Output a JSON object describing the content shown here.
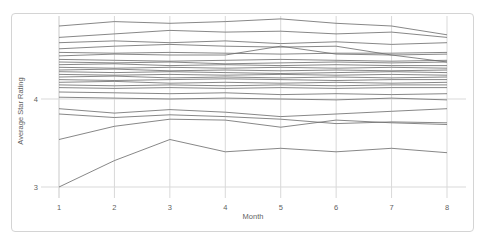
{
  "frame": {
    "background": "#ffffff",
    "card_border_color": "#d4d4d4"
  },
  "chart_data": {
    "type": "line",
    "title": "",
    "xlabel": "Month",
    "ylabel": "Average Star Rating",
    "x": [
      1,
      2,
      3,
      4,
      5,
      6,
      7,
      8
    ],
    "x_tick_labels": [
      "1",
      "2",
      "3",
      "4",
      "5",
      "6",
      "7",
      "8"
    ],
    "y_ticks": [
      {
        "value": 3,
        "label": "3"
      },
      {
        "value": 4,
        "label": "4"
      }
    ],
    "xlim": [
      1,
      8
    ],
    "ylim": [
      2.875,
      4.94
    ],
    "grid": true,
    "legend_position": "none",
    "line_color": "#6b6b6b",
    "grid_color": "#d9d9d9",
    "axis_text_color": "#5f5f5f",
    "series": [
      {
        "name": "line-01",
        "values": [
          4.83,
          4.88,
          4.86,
          4.88,
          4.91,
          4.86,
          4.83,
          4.73
        ]
      },
      {
        "name": "line-02",
        "values": [
          4.7,
          4.74,
          4.78,
          4.76,
          4.77,
          4.74,
          4.76,
          4.7
        ]
      },
      {
        "name": "line-03",
        "values": [
          4.64,
          4.66,
          4.64,
          4.66,
          4.63,
          4.65,
          4.62,
          4.64
        ]
      },
      {
        "name": "line-04",
        "values": [
          4.57,
          4.6,
          4.62,
          4.6,
          4.59,
          4.6,
          4.5,
          4.42
        ]
      },
      {
        "name": "line-05",
        "values": [
          4.49,
          4.51,
          4.5,
          4.5,
          4.6,
          4.51,
          4.5,
          4.51
        ]
      },
      {
        "name": "line-06",
        "values": [
          4.53,
          4.52,
          4.53,
          4.52,
          4.51,
          4.52,
          4.52,
          4.53
        ]
      },
      {
        "name": "line-07",
        "values": [
          4.45,
          4.44,
          4.43,
          4.44,
          4.45,
          4.44,
          4.43,
          4.44
        ]
      },
      {
        "name": "line-08",
        "values": [
          4.42,
          4.41,
          4.42,
          4.4,
          4.41,
          4.42,
          4.41,
          4.42
        ]
      },
      {
        "name": "line-09",
        "values": [
          4.39,
          4.4,
          4.38,
          4.39,
          4.38,
          4.39,
          4.38,
          4.38
        ]
      },
      {
        "name": "line-10",
        "values": [
          4.36,
          4.35,
          4.36,
          4.35,
          4.36,
          4.35,
          4.36,
          4.35
        ]
      },
      {
        "name": "line-11",
        "values": [
          4.33,
          4.34,
          4.32,
          4.33,
          4.32,
          4.33,
          4.32,
          4.33
        ]
      },
      {
        "name": "line-12",
        "values": [
          4.31,
          4.3,
          4.31,
          4.3,
          4.29,
          4.3,
          4.31,
          4.3
        ]
      },
      {
        "name": "line-13",
        "values": [
          4.28,
          4.27,
          4.28,
          4.27,
          4.28,
          4.27,
          4.28,
          4.27
        ]
      },
      {
        "name": "line-14",
        "values": [
          4.25,
          4.26,
          4.24,
          4.25,
          4.24,
          4.25,
          4.24,
          4.25
        ]
      },
      {
        "name": "line-15",
        "values": [
          4.22,
          4.21,
          4.22,
          4.23,
          4.22,
          4.21,
          4.22,
          4.22
        ]
      },
      {
        "name": "line-16",
        "values": [
          4.19,
          4.2,
          4.18,
          4.19,
          4.18,
          4.19,
          4.18,
          4.19
        ]
      },
      {
        "name": "line-17",
        "values": [
          4.16,
          4.15,
          4.16,
          4.15,
          4.16,
          4.15,
          4.16,
          4.16
        ]
      },
      {
        "name": "line-18",
        "values": [
          4.13,
          4.12,
          4.13,
          4.12,
          4.13,
          4.12,
          4.13,
          4.13
        ]
      },
      {
        "name": "line-19",
        "values": [
          4.08,
          4.07,
          4.06,
          4.07,
          4.05,
          4.06,
          4.05,
          4.06
        ]
      },
      {
        "name": "line-20",
        "values": [
          4.02,
          4.01,
          4.0,
          4.01,
          4.0,
          3.99,
          4.01,
          3.99
        ]
      },
      {
        "name": "line-21",
        "values": [
          3.89,
          3.84,
          3.88,
          3.85,
          3.8,
          3.83,
          3.86,
          3.89
        ]
      },
      {
        "name": "line-22",
        "values": [
          3.83,
          3.79,
          3.82,
          3.8,
          3.77,
          3.72,
          3.74,
          3.73
        ]
      },
      {
        "name": "line-23",
        "values": [
          3.54,
          3.69,
          3.77,
          3.76,
          3.68,
          3.76,
          3.73,
          3.71
        ]
      },
      {
        "name": "line-24",
        "values": [
          3.0,
          3.3,
          3.54,
          3.4,
          3.44,
          3.4,
          3.44,
          3.39
        ]
      }
    ]
  }
}
